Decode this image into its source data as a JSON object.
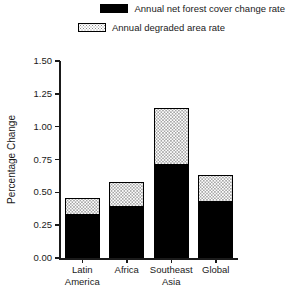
{
  "chart_data": {
    "type": "bar",
    "stacked": true,
    "title": "",
    "xlabel": "",
    "ylabel": "Percentage Change",
    "ylim": [
      0.0,
      1.5
    ],
    "ytick_labels": [
      "1.50",
      "1.25",
      "1.00",
      "0.75",
      "0.50",
      "0.25",
      "0.00"
    ],
    "ytick_values": [
      1.5,
      1.25,
      1.0,
      0.75,
      0.5,
      0.25,
      0.0
    ],
    "grid": false,
    "legend_position": "top-right",
    "categories": [
      "Latin America",
      "Africa",
      "Southeast Asia",
      "Global"
    ],
    "category_lines": [
      [
        "Latin",
        "America"
      ],
      [
        "Africa",
        ""
      ],
      [
        "Southeast",
        "Asia"
      ],
      [
        "Global",
        ""
      ]
    ],
    "series": [
      {
        "name": "Annual net forest cover change rate",
        "swatch": "solid-black",
        "color": "#000000",
        "values": [
          0.33,
          0.39,
          0.71,
          0.43
        ]
      },
      {
        "name": "Annual degraded area rate",
        "swatch": "dotted-white",
        "color": "#ffffff",
        "values": [
          0.13,
          0.19,
          0.43,
          0.2
        ]
      }
    ],
    "totals": [
      0.46,
      0.58,
      1.14,
      0.63
    ]
  },
  "legend": {
    "items": [
      {
        "label": "Annual net forest cover change rate",
        "swatch": "solid-black-swatch"
      },
      {
        "label": "Annual degraded area rate",
        "swatch": "dotted-white-swatch"
      }
    ]
  },
  "axes": {
    "y_title": "Percentage Change"
  }
}
